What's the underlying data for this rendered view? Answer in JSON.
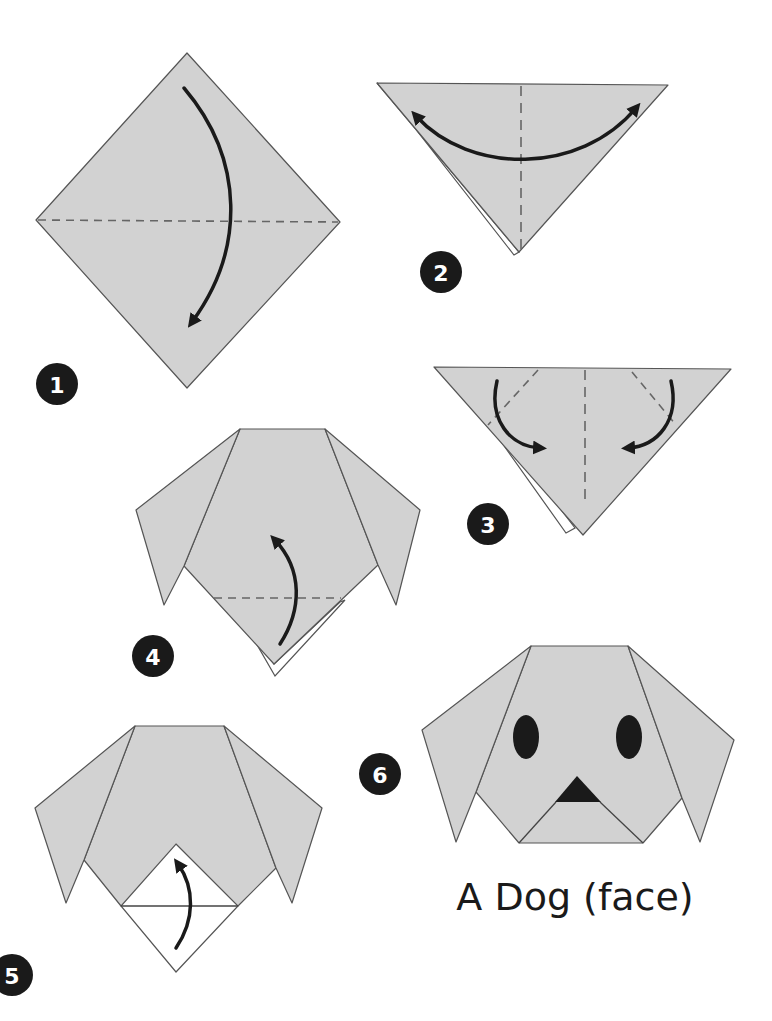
{
  "title": "A Dog (face)",
  "steps": [
    {
      "number": "1",
      "action": "fold top corner down to bottom corner"
    },
    {
      "number": "2",
      "action": "fold in half and unfold"
    },
    {
      "number": "3",
      "action": "fold side corners down to form ears"
    },
    {
      "number": "4",
      "action": "fold bottom tip up"
    },
    {
      "number": "5",
      "action": "fold tip up to form nose"
    },
    {
      "number": "6",
      "action": "draw eyes and nose"
    }
  ],
  "colors": {
    "paper": "#d2d2d2",
    "outline": "#555555",
    "arrow": "#1a1a1a",
    "badge": "#1a1a1a",
    "background": "#ffffff"
  }
}
